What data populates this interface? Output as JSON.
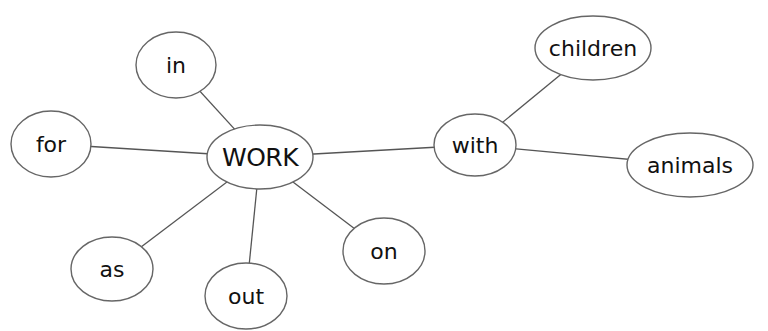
{
  "diagram": {
    "type": "mind-map",
    "center": {
      "id": "work",
      "label": "WORK"
    },
    "nodes": [
      {
        "id": "work",
        "label": "WORK"
      },
      {
        "id": "in",
        "label": "in"
      },
      {
        "id": "for",
        "label": "for"
      },
      {
        "id": "as",
        "label": "as"
      },
      {
        "id": "out",
        "label": "out"
      },
      {
        "id": "on",
        "label": "on"
      },
      {
        "id": "with",
        "label": "with"
      },
      {
        "id": "children",
        "label": "children"
      },
      {
        "id": "animals",
        "label": "animals"
      }
    ],
    "edges": [
      {
        "from": "work",
        "to": "in"
      },
      {
        "from": "work",
        "to": "for"
      },
      {
        "from": "work",
        "to": "as"
      },
      {
        "from": "work",
        "to": "out"
      },
      {
        "from": "work",
        "to": "on"
      },
      {
        "from": "work",
        "to": "with"
      },
      {
        "from": "with",
        "to": "children"
      },
      {
        "from": "with",
        "to": "animals"
      }
    ],
    "colors": {
      "background": "#ffffff",
      "outline": "#666666",
      "text": "#111111"
    }
  }
}
